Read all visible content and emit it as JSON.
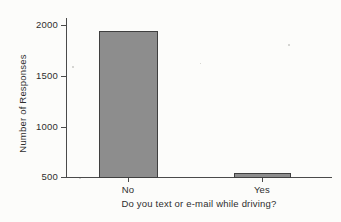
{
  "chart_data": {
    "type": "bar",
    "title": "",
    "subtitle": "",
    "categories": [
      "No",
      "Yes"
    ],
    "values": [
      1985,
      545
    ],
    "series": [
      {
        "name": "Number of Responses",
        "values": [
          1985,
          545
        ]
      }
    ],
    "xlabel": "Do you text or e-mail while driving?",
    "ylabel": "Number of Responses",
    "ylim": [
      500,
      2050
    ],
    "yticks": [
      500,
      1000,
      1500,
      2000
    ],
    "ytick_labels": [
      "500",
      "1000",
      "1500",
      "2000"
    ],
    "grid": false,
    "legend": false,
    "legend_position": "none",
    "bar_color": "#8d8d8d",
    "bar_edge_color": "#3f3f3f",
    "axis_color": "#4a4a4a",
    "background_color": "#fcfcfa",
    "text_color": "#2e2e2e"
  }
}
